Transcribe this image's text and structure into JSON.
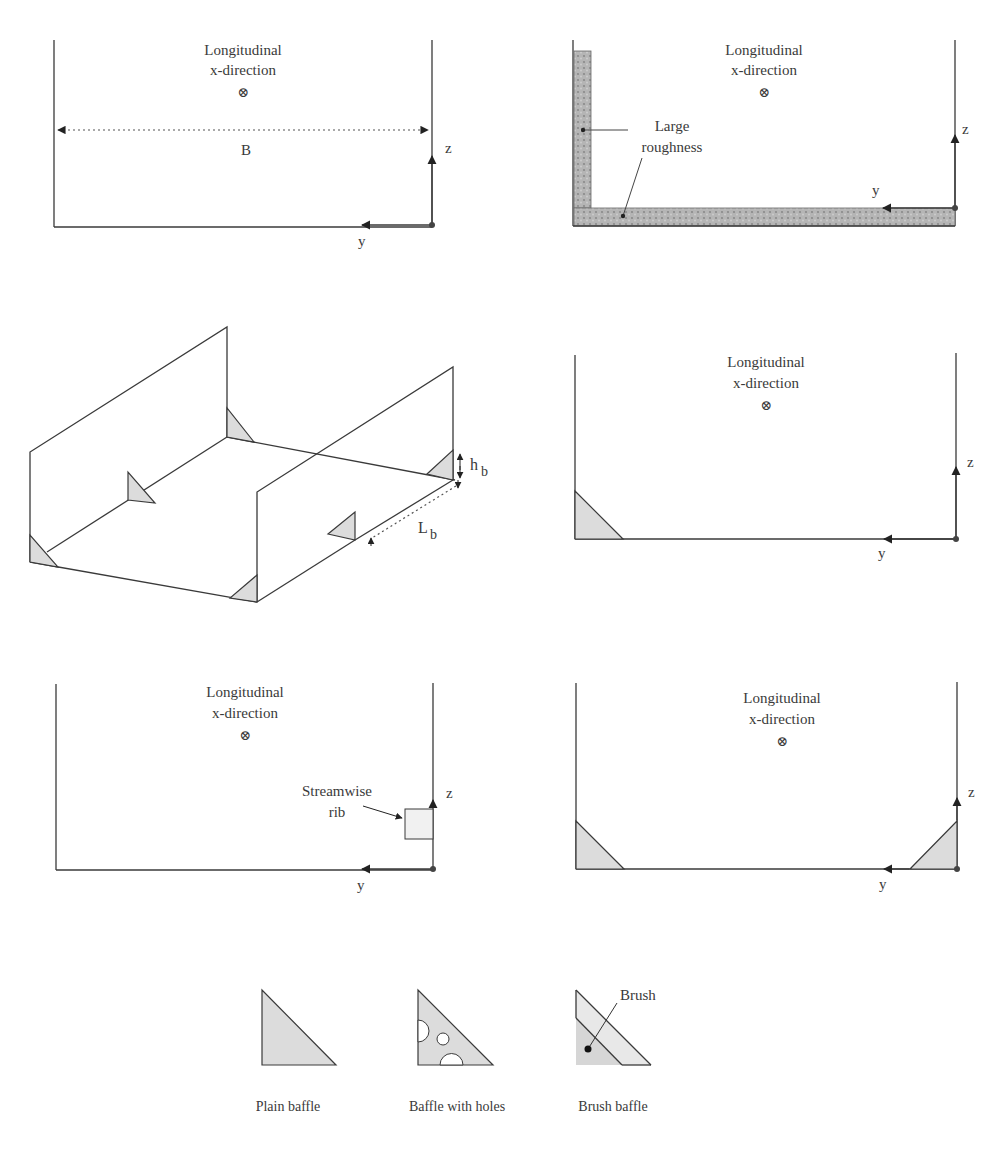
{
  "panels": {
    "top_left": {
      "direction_label_line1": "Longitudinal",
      "direction_label_line2": "x-direction",
      "direction_symbol": "⊗",
      "width_label": "B",
      "axis_z": "z",
      "axis_y": "y"
    },
    "top_right": {
      "direction_label_line1": "Longitudinal",
      "direction_label_line2": "x-direction",
      "direction_symbol": "⊗",
      "roughness_label_line1": "Large",
      "roughness_label_line2": "roughness",
      "axis_z": "z",
      "axis_y": "y"
    },
    "middle_left": {
      "baffle_height_label": "h",
      "baffle_height_sub": "b",
      "baffle_spacing_label": "L",
      "baffle_spacing_sub": "b"
    },
    "middle_right": {
      "direction_label_line1": "Longitudinal",
      "direction_label_line2": "x-direction",
      "direction_symbol": "⊗",
      "axis_z": "z",
      "axis_y": "y"
    },
    "bottom_left": {
      "direction_label_line1": "Longitudinal",
      "direction_label_line2": "x-direction",
      "direction_symbol": "⊗",
      "rib_label_line1": "Streamwise",
      "rib_label_line2": "rib",
      "axis_z": "z",
      "axis_y": "y"
    },
    "bottom_right": {
      "direction_label_line1": "Longitudinal",
      "direction_label_line2": "x-direction",
      "direction_symbol": "⊗",
      "axis_z": "z",
      "axis_y": "y"
    }
  },
  "legend": {
    "items": [
      {
        "label": "Plain baffle",
        "shape": "plain-triangle"
      },
      {
        "label": "Baffle with holes",
        "shape": "holed-triangle"
      },
      {
        "label": "Brush baffle",
        "shape": "brush-triangle",
        "callout": "Brush"
      }
    ]
  },
  "colors": {
    "line": "#3a3a3a",
    "baffle_fill": "#dcdcdc",
    "roughness_fill": "#a8a8a8"
  }
}
